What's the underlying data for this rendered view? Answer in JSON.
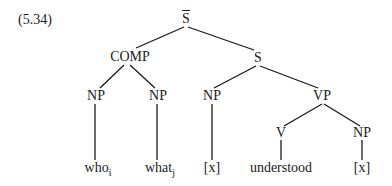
{
  "example_number": "(5.34)",
  "tree": {
    "root": {
      "label": "S",
      "bar": true
    },
    "nodes": {
      "comp": "COMP",
      "s": "S",
      "comp_np1": "NP",
      "comp_np2": "NP",
      "s_np": "NP",
      "vp": "VP",
      "v": "V",
      "vp_np": "NP"
    },
    "leaves": {
      "who": {
        "word": "who",
        "index": "i"
      },
      "what": {
        "word": "what",
        "index": "j"
      },
      "x1": "[x]",
      "understood": "understood",
      "x2": "[x]"
    }
  }
}
